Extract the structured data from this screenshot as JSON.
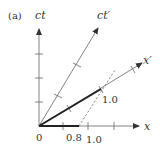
{
  "figure": {
    "panel_label": "(a)",
    "type": "spacetime-diagram",
    "axes": {
      "ct": {
        "label": "ct"
      },
      "x": {
        "label": "x"
      },
      "ct_prime": {
        "label": "ct′"
      },
      "x_prime": {
        "label": "x′"
      }
    },
    "tick_labels": {
      "origin": "0",
      "x_08": "0.8",
      "x_10": "1.0",
      "xprime_10": "1.0"
    },
    "colors": {
      "axis": "#555555",
      "thick": "#222222",
      "text": "#333333"
    }
  }
}
